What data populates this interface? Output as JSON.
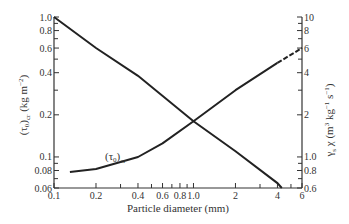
{
  "chart_data": {
    "type": "line",
    "title": "",
    "xlabel": "Particle diameter (mm)",
    "ylabel_left": "(τ0)cr (kg m⁻²)",
    "ylabel_right": "γs χ (m³ kg⁻¹ s⁻¹)",
    "xscale": "log",
    "yscale": "log",
    "xlim": [
      0.1,
      6
    ],
    "ylim_left": [
      0.06,
      1.0
    ],
    "ylim_right": [
      0.6,
      10
    ],
    "x_ticks": [
      "0.1",
      "0.2",
      "0.4",
      "0.6",
      "0.8",
      "1.0",
      "2",
      "4",
      "6"
    ],
    "y_ticks_left": [
      "0.06",
      "0.08",
      "0.1",
      "0.2",
      "0.4",
      "0.6",
      "0.8",
      "1.0"
    ],
    "y_ticks_right": [
      "0.6",
      "0.8",
      "1.0",
      "2",
      "4",
      "6",
      "8",
      "10"
    ],
    "grid": false,
    "series": [
      {
        "name": "γs χ",
        "axis": "left-scale line",
        "style": "solid straight",
        "x": [
          0.1,
          0.2,
          0.4,
          1.0,
          2,
          4,
          4.3
        ],
        "values": [
          1.0,
          0.6,
          0.38,
          0.18,
          0.11,
          0.065,
          0.06
        ]
      },
      {
        "name": "(τ0)cr",
        "axis": "curve",
        "style": "solid, dashed beyond ~4",
        "x": [
          0.13,
          0.2,
          0.4,
          0.6,
          1.0,
          2,
          4,
          6
        ],
        "values": [
          0.078,
          0.082,
          0.1,
          0.125,
          0.18,
          0.3,
          0.47,
          0.6
        ]
      }
    ],
    "annotations": [
      {
        "text": "(τ0)cr",
        "x": 0.35,
        "y": 0.095
      }
    ]
  },
  "labels": {
    "xlabel": "Particle diameter (mm)",
    "curve_label_main": "(τ",
    "curve_label_sub0": "0",
    "curve_label_close": ")",
    "curve_label_subcr": "cr",
    "left_a": "(τ",
    "left_sub0": "0",
    "left_b": ")",
    "left_subcr": "cr",
    "left_c": " (kg m",
    "left_sup": "−2",
    "left_d": ")",
    "right_a": "γ",
    "right_subs": "s",
    "right_b": " χ (m",
    "right_sup3": "3",
    "right_c": " kg",
    "right_sup1": "−1",
    "right_d": " s",
    "right_sup1b": "−1",
    "right_e": ")"
  }
}
